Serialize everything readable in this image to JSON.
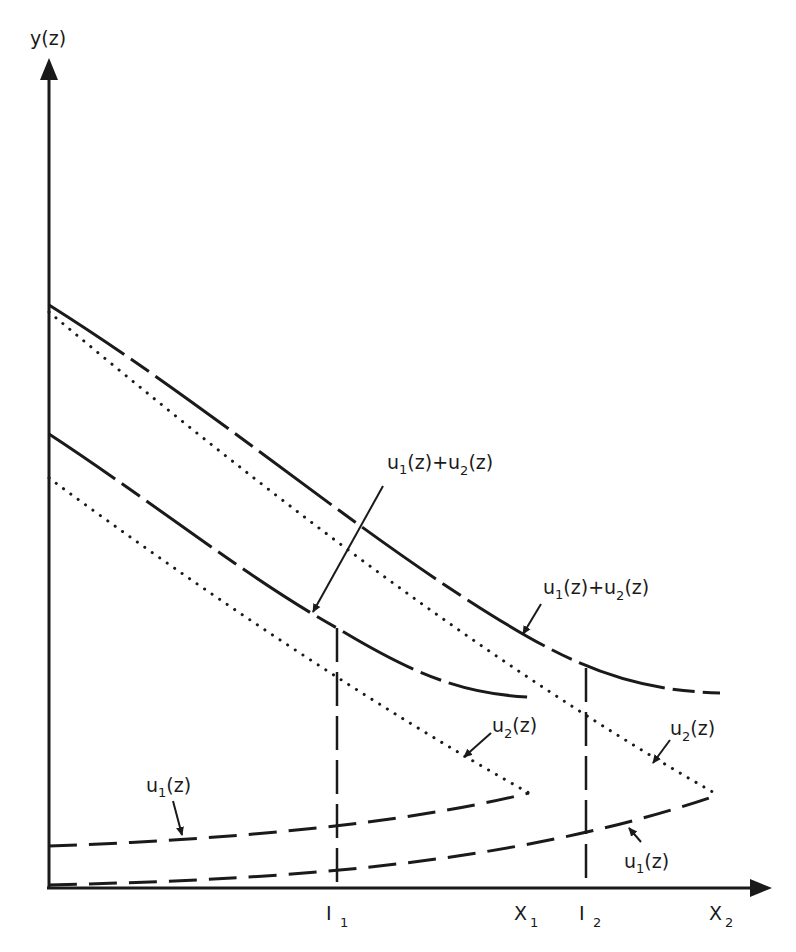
{
  "diagram": {
    "y_axis_label": "y(z)",
    "x_ticks": [
      {
        "id": "I1",
        "main": "I",
        "sub": "1"
      },
      {
        "id": "X1",
        "main": "X",
        "sub": "1"
      },
      {
        "id": "I2",
        "main": "I",
        "sub": "2"
      },
      {
        "id": "X2",
        "main": "X",
        "sub": "2"
      }
    ],
    "labels": {
      "sum_case1": {
        "u1": "u",
        "s1": "1",
        "mid": "(z)+u",
        "s2": "2",
        "tail": "(z)"
      },
      "sum_case2": {
        "u1": "u",
        "s1": "1",
        "mid": "(z)+u",
        "s2": "2",
        "tail": "(z)"
      },
      "u2_case1": {
        "u": "u",
        "s": "2",
        "tail": "(z)"
      },
      "u2_case2": {
        "u": "u",
        "s": "2",
        "tail": "(z)"
      },
      "u1_case1": {
        "u": "u",
        "s": "1",
        "tail": "(z)"
      },
      "u1_case2": {
        "u": "u",
        "s": "1",
        "tail": "(z)"
      }
    },
    "line_styles": {
      "sum": "long-dash-solid",
      "u2": "dotted",
      "u1": "dashed",
      "I_markers": "dashed-vertical"
    },
    "color": "#1a1a1a"
  }
}
